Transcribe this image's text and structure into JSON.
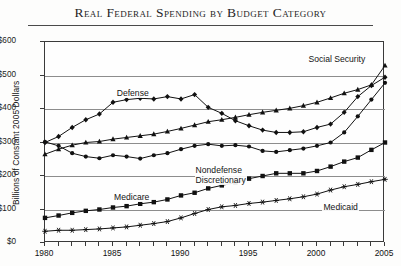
{
  "chart_data": {
    "type": "line",
    "title": "Real Federal Spending by Budget Category",
    "xlabel": "",
    "ylabel": "Billions of Constant 2005 Dollars",
    "xlim": [
      1980,
      2005
    ],
    "ylim": [
      0,
      600
    ],
    "ytick_labels": [
      "$0",
      "$100",
      "$200",
      "$300",
      "$400",
      "$500",
      "$600"
    ],
    "ytick_values": [
      0,
      100,
      200,
      300,
      400,
      500,
      600
    ],
    "xtick_labels": [
      "1980",
      "1985",
      "1990",
      "1995",
      "2000",
      "2005"
    ],
    "xtick_values": [
      1980,
      1985,
      1990,
      1995,
      2000,
      2005
    ],
    "grid": true,
    "legend_position": "inline-annotations",
    "x": [
      1980,
      1981,
      1982,
      1983,
      1984,
      1985,
      1986,
      1987,
      1988,
      1989,
      1990,
      1991,
      1992,
      1993,
      1994,
      1995,
      1996,
      1997,
      1998,
      1999,
      2000,
      2001,
      2002,
      2003,
      2004,
      2005
    ],
    "series": [
      {
        "name": "Defense",
        "marker": "diamond",
        "values": [
          300,
          318,
          345,
          368,
          385,
          420,
          428,
          432,
          430,
          437,
          430,
          443,
          405,
          387,
          365,
          350,
          337,
          330,
          330,
          332,
          345,
          355,
          390,
          437,
          470,
          495
        ]
      },
      {
        "name": "Social Security",
        "marker": "triangle",
        "values": [
          265,
          280,
          292,
          300,
          303,
          310,
          315,
          320,
          325,
          333,
          342,
          352,
          362,
          368,
          375,
          383,
          390,
          396,
          402,
          410,
          420,
          433,
          447,
          458,
          472,
          530
        ]
      },
      {
        "name": "Nondefense Discretionary",
        "marker": "circle",
        "values": [
          302,
          290,
          268,
          258,
          253,
          262,
          258,
          252,
          262,
          268,
          280,
          290,
          295,
          290,
          292,
          288,
          275,
          272,
          277,
          282,
          290,
          300,
          330,
          378,
          428,
          478
        ]
      },
      {
        "name": "Medicare",
        "marker": "square",
        "values": [
          75,
          82,
          90,
          96,
          100,
          106,
          110,
          117,
          122,
          130,
          142,
          150,
          163,
          172,
          180,
          192,
          200,
          208,
          208,
          208,
          215,
          228,
          243,
          255,
          278,
          300
        ]
      },
      {
        "name": "Medicaid",
        "marker": "star",
        "values": [
          35,
          38,
          38,
          40,
          42,
          45,
          48,
          53,
          58,
          64,
          75,
          88,
          100,
          108,
          112,
          118,
          122,
          127,
          132,
          138,
          146,
          158,
          168,
          175,
          183,
          190
        ]
      }
    ],
    "annotations": [
      {
        "text": "Defense",
        "series": "Defense"
      },
      {
        "text": "Social Security",
        "series": "Social Security"
      },
      {
        "text": "Nondefense",
        "series": "Nondefense Discretionary"
      },
      {
        "text": "Discretionary",
        "series": "Nondefense Discretionary"
      },
      {
        "text": "Medicare",
        "series": "Medicare"
      },
      {
        "text": "Medicaid",
        "series": "Medicaid"
      }
    ],
    "colors": {
      "series_stroke": "#111111",
      "grid": "#8d8d8d",
      "frame": "#3a3a3a"
    }
  }
}
